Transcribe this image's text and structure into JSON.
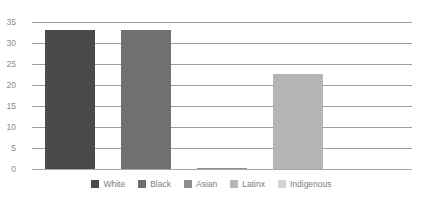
{
  "chart_data": {
    "type": "bar",
    "title": "",
    "xlabel": "",
    "ylabel": "",
    "ylim": [
      0,
      35
    ],
    "yticks": [
      35,
      30,
      25,
      20,
      15,
      10,
      5,
      0
    ],
    "grid": true,
    "legend_position": "bottom",
    "categories": [
      "White",
      "Black",
      "Asian",
      "Latinx",
      "Indigenous"
    ],
    "values": [
      33,
      33,
      0.3,
      22.7,
      0
    ],
    "colors": [
      "#4a4a4a",
      "#707070",
      "#8f8f8f",
      "#b5b5b5",
      "#d2d2d2"
    ],
    "series": [
      {
        "name": "White",
        "value": 33,
        "color": "#4a4a4a"
      },
      {
        "name": "Black",
        "value": 33,
        "color": "#707070"
      },
      {
        "name": "Asian",
        "value": 0.3,
        "color": "#8f8f8f"
      },
      {
        "name": "Latinx",
        "value": 22.7,
        "color": "#b5b5b5"
      },
      {
        "name": "Indigenous",
        "value": 0,
        "color": "#d2d2d2"
      }
    ]
  },
  "axis": {
    "tick_labels": [
      "35",
      "30",
      "25",
      "20",
      "15",
      "10",
      "5",
      "0"
    ]
  },
  "legend": {
    "items": [
      {
        "label": "White",
        "color": "#4a4a4a"
      },
      {
        "label": "Black",
        "color": "#707070"
      },
      {
        "label": "Asian",
        "color": "#8f8f8f"
      },
      {
        "label": "Latinx",
        "color": "#b5b5b5"
      },
      {
        "label": "Indigenous",
        "color": "#d2d2d2"
      }
    ]
  },
  "style": {
    "gridline_color": "#9e9e9e",
    "tick_text_color": "#8a8a8a",
    "legend_text_color": "#7d7d7d",
    "background": "#ffffff"
  }
}
